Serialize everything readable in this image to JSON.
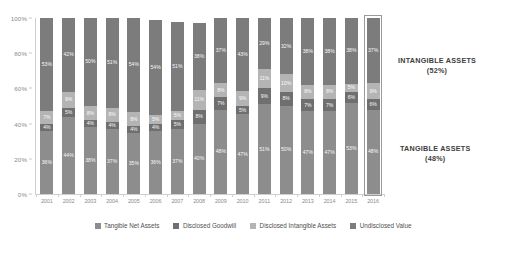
{
  "chart_data": {
    "type": "bar",
    "title": "",
    "subtitle": "",
    "xlabel": "",
    "ylabel": "",
    "ylim": [
      0,
      100
    ],
    "ytick_labels": [
      "0%",
      "20%",
      "40%",
      "60%",
      "80%",
      "100%"
    ],
    "ytick_values": [
      0,
      20,
      40,
      60,
      80,
      100
    ],
    "grid": false,
    "stacked": true,
    "stack_order_bottom_to_top": [
      "Tangible Net Assets",
      "Disclosed Goodwill",
      "Disclosed Intangible Assets",
      "Undisclosed Value"
    ],
    "legend_position": "bottom",
    "categories": [
      "2001",
      "2002",
      "2003",
      "2004",
      "2005",
      "2006",
      "2007",
      "2008",
      "2009",
      "2010",
      "2011",
      "2012",
      "2013",
      "2014",
      "2015",
      "2016"
    ],
    "series": [
      {
        "name": "Tangible Net Assets",
        "color": "#8d8d8d",
        "values": [
          36,
          44,
          38,
          37,
          35,
          36,
          37,
          40,
          48,
          47,
          51,
          50,
          47,
          47,
          53,
          48
        ],
        "labels": [
          "36%",
          "44%",
          "38%",
          "37%",
          "35%",
          "36%",
          "37%",
          "40%",
          "48%",
          "47%",
          "51%",
          "50%",
          "47%",
          "47%",
          "53%",
          "48%"
        ]
      },
      {
        "name": "Disclosed Goodwill",
        "color": "#6f6f6f",
        "values": [
          4,
          5,
          4,
          4,
          4,
          4,
          5,
          8,
          7,
          5,
          9,
          8,
          7,
          7,
          6,
          6
        ],
        "labels": [
          "4%",
          "5%",
          "4%",
          "4%",
          "4%",
          "4%",
          "5%",
          "8%",
          "7%",
          "5%",
          "9%",
          "8%",
          "7%",
          "7%",
          "6%",
          "6%"
        ]
      },
      {
        "name": "Disclosed Intangible Assets",
        "color": "#b4b4b4",
        "values": [
          7,
          9,
          8,
          8,
          8,
          5,
          5,
          11,
          8,
          9,
          11,
          10,
          8,
          8,
          5,
          9
        ],
        "labels": [
          "7%",
          "9%",
          "8%",
          "8%",
          "8%",
          "5%",
          "5%",
          "11%",
          "8%",
          "9%",
          "11%",
          "10%",
          "8%",
          "8%",
          "5%",
          "9%"
        ]
      },
      {
        "name": "Undisclosed Value",
        "color": "#7c7c7c",
        "values": [
          53,
          42,
          50,
          51,
          54,
          54,
          51,
          38,
          37,
          43,
          29,
          32,
          38,
          38,
          38,
          37
        ],
        "labels": [
          "53%",
          "42%",
          "50%",
          "51%",
          "54%",
          "54%",
          "51%",
          "38%",
          "37%",
          "43%",
          "29%",
          "32%",
          "38%",
          "38%",
          "38%",
          "37%"
        ]
      }
    ],
    "annotations": [
      {
        "name": "intangible-assets",
        "title": "INTANGIBLE ASSETS",
        "value": "(52%)"
      },
      {
        "name": "tangible-assets",
        "title": "TANGIBLE ASSETS",
        "value": "(48%)"
      }
    ],
    "highlight": {
      "category": "2016",
      "color": "#9a9a9a"
    }
  }
}
